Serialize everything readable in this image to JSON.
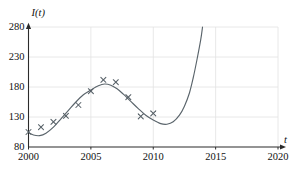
{
  "chart_data": {
    "type": "scatter",
    "title": "",
    "subtitle": "",
    "xlabel": "t",
    "ylabel": "I(t)",
    "xlim": [
      2000,
      2020
    ],
    "ylim": [
      80,
      280
    ],
    "xticks": [
      2000,
      2005,
      2010,
      2015,
      2020
    ],
    "xtick_labels": [
      "2000",
      "2005",
      "2010",
      "2015",
      "2020"
    ],
    "yticks": [
      80,
      130,
      180,
      230,
      280
    ],
    "ytick_labels": [
      "80",
      "130",
      "180",
      "230",
      "280"
    ],
    "grid": "both",
    "legend": "none",
    "marker": "x",
    "marker_color": "#555f66",
    "curve_color": "#5a646b",
    "axis_color": "#2b2b2b",
    "grid_color": "#e2e2e2",
    "x": [
      2000,
      2001,
      2002,
      2003,
      2004,
      2005,
      2006,
      2007,
      2008,
      2009,
      2010
    ],
    "values": [
      105,
      113,
      122,
      132,
      150,
      173,
      192,
      188,
      163,
      131,
      136
    ],
    "series": [
      {
        "name": "observed data",
        "type": "scatter",
        "points": [
          {
            "x": 2000,
            "y": 105
          },
          {
            "x": 2001,
            "y": 113
          },
          {
            "x": 2002,
            "y": 122
          },
          {
            "x": 2003,
            "y": 132
          },
          {
            "x": 2004,
            "y": 150
          },
          {
            "x": 2005,
            "y": 173
          },
          {
            "x": 2006,
            "y": 192
          },
          {
            "x": 2007,
            "y": 188
          },
          {
            "x": 2008,
            "y": 163
          },
          {
            "x": 2009,
            "y": 131
          },
          {
            "x": 2010,
            "y": 136
          }
        ]
      },
      {
        "name": "fitted curve",
        "type": "line",
        "points": [
          {
            "x": 2000.0,
            "y": 104
          },
          {
            "x": 2000.4,
            "y": 100
          },
          {
            "x": 2000.9,
            "y": 99
          },
          {
            "x": 2001.4,
            "y": 103
          },
          {
            "x": 2002.0,
            "y": 113
          },
          {
            "x": 2002.6,
            "y": 127
          },
          {
            "x": 2003.2,
            "y": 141
          },
          {
            "x": 2003.8,
            "y": 155
          },
          {
            "x": 2004.4,
            "y": 167
          },
          {
            "x": 2005.0,
            "y": 175
          },
          {
            "x": 2005.6,
            "y": 182
          },
          {
            "x": 2006.1,
            "y": 185
          },
          {
            "x": 2006.6,
            "y": 183
          },
          {
            "x": 2007.1,
            "y": 177
          },
          {
            "x": 2007.6,
            "y": 168
          },
          {
            "x": 2008.2,
            "y": 156
          },
          {
            "x": 2008.8,
            "y": 144
          },
          {
            "x": 2009.4,
            "y": 133
          },
          {
            "x": 2010.0,
            "y": 125
          },
          {
            "x": 2010.6,
            "y": 119
          },
          {
            "x": 2011.1,
            "y": 118
          },
          {
            "x": 2011.6,
            "y": 122
          },
          {
            "x": 2012.1,
            "y": 133
          },
          {
            "x": 2012.5,
            "y": 148
          },
          {
            "x": 2012.9,
            "y": 170
          },
          {
            "x": 2013.2,
            "y": 195
          },
          {
            "x": 2013.5,
            "y": 225
          },
          {
            "x": 2013.8,
            "y": 258
          },
          {
            "x": 2013.95,
            "y": 280
          }
        ]
      }
    ],
    "annotations": []
  }
}
